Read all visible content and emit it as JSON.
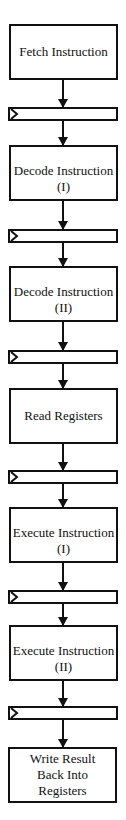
{
  "diagram": {
    "stages": [
      {
        "line1": "Fetch Instruction",
        "line2": ""
      },
      {
        "line1": "Decode Instruction",
        "line2": "(I)"
      },
      {
        "line1": "Decode Instruction",
        "line2": "(II)"
      },
      {
        "line1": "Read Registers",
        "line2": ""
      },
      {
        "line1": "Execute Instruction",
        "line2": "(I)"
      },
      {
        "line1": "Execute Instruction",
        "line2": "(II)"
      },
      {
        "line1": "Write Result",
        "line2": "Back Into",
        "line3": "Registers"
      }
    ],
    "pipeline_register_count": 6
  }
}
